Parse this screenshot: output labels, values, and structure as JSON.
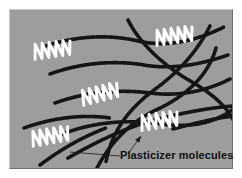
{
  "figure": {
    "kind": "polymer-plasticizer-schematic",
    "panel": {
      "background_color": "#9d9d9d",
      "border_light_color": "#c9c9c9",
      "border_dark_color": "#6e6e6e",
      "x": 9,
      "y": 9,
      "width": 224,
      "height": 160
    },
    "page_background_color": "#ffffff"
  },
  "annotations": {
    "label": "Plasticizer molecules",
    "label_color": "#111111",
    "leader_color": "#1a1a1a"
  },
  "legend_items": [
    {
      "name": "polymer-chain",
      "color": "#151515",
      "style": "beaded-dark-curve"
    },
    {
      "name": "plasticizer-molecule",
      "color": "#ffffff",
      "style": "white-zigzag-coil"
    }
  ],
  "diagram_data": {
    "type": "schematic",
    "viewbox": [
      0,
      0,
      224,
      160
    ],
    "polymer_chain_color": "#151515",
    "plasticizer_color": "#ffffff",
    "polymer_chains": [
      {
        "id": "chain-1",
        "d": "M 36 36 C 66 26, 98 24, 128 31 C 158 38, 188 30, 214 17"
      },
      {
        "id": "chain-2",
        "d": "M 40 64 C 70 53, 104 50, 134 55 C 164 60, 192 54, 218 45"
      },
      {
        "id": "chain-3",
        "d": "M 45 93 C 76 82, 108 79, 140 83 C 172 87, 198 80, 220 69"
      },
      {
        "id": "chain-4",
        "d": "M 50 125 C 82 112, 118 109, 152 114 C 186 119, 208 110, 222 100"
      },
      {
        "id": "chain-5",
        "d": "M 86 160 C 98 136, 118 113, 146 100 C 176 86, 198 66, 206 38"
      },
      {
        "id": "chain-6",
        "d": "M 200 16 C 186 44, 166 64, 144 80 C 120 98, 102 120, 96 152"
      },
      {
        "id": "chain-7",
        "d": "M 118 10 C 130 34, 154 56, 182 72 C 206 86, 220 100, 226 116"
      },
      {
        "id": "chain-8",
        "d": "M 58 148 C 86 132, 118 116, 152 108 C 182 101, 206 97, 224 96"
      },
      {
        "id": "chain-9",
        "d": "M 163 119 C 186 113, 206 108, 224 106"
      },
      {
        "id": "chain-10",
        "d": "M 14 118 C 42 108, 72 104, 100 108"
      },
      {
        "id": "chain-11",
        "d": "M 30 155 C 50 140, 72 127, 96 118"
      }
    ],
    "plasticizer_molecules": [
      {
        "id": "plasticizer-top-left",
        "x": 24,
        "y": 42,
        "scale": 1.0,
        "rotation": -8,
        "loops": 5
      },
      {
        "id": "plasticizer-top-right",
        "x": 146,
        "y": 28,
        "scale": 1.0,
        "rotation": -8,
        "loops": 5
      },
      {
        "id": "plasticizer-center",
        "x": 72,
        "y": 88,
        "scale": 1.0,
        "rotation": -14,
        "loops": 5
      },
      {
        "id": "plasticizer-bottom-left",
        "x": 22,
        "y": 129,
        "scale": 1.0,
        "rotation": -10,
        "loops": 5
      },
      {
        "id": "plasticizer-bottom-right",
        "x": 131,
        "y": 113,
        "scale": 1.0,
        "rotation": -8,
        "loops": 5
      }
    ],
    "leader_lines": [
      {
        "id": "leader-to-bottom-right",
        "d": "M 118 144 L 131 126",
        "arrow": true,
        "arrow_at": [
          131,
          126
        ],
        "arrow_angle": -54
      },
      {
        "id": "leader-to-bottom-left",
        "d": "M 110 146 L 60 142",
        "arrow": false
      }
    ]
  }
}
